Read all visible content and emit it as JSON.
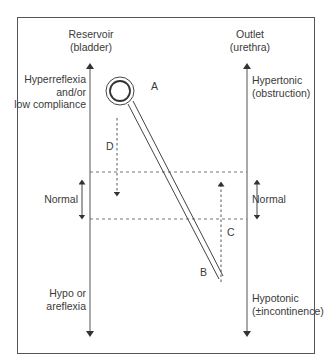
{
  "reservoir": {
    "title_line1": "Reservoir",
    "title_line2": "(bladder)",
    "upper_line1": "Hyperreflexia",
    "upper_line2": "and/or",
    "upper_line3": "low compliance",
    "normal": "Normal",
    "lower_line1": "Hypo or",
    "lower_line2": "areflexia"
  },
  "outlet": {
    "title_line1": "Outlet",
    "title_line2": "(urethra)",
    "upper_line1": "Hypertonic",
    "upper_line2": "(obstruction)",
    "normal": "Normal",
    "lower_line1": "Hypotonic",
    "lower_line2": "(±incontinence)"
  },
  "markers": {
    "a": "A",
    "b": "B",
    "c": "C",
    "d": "D"
  },
  "colors": {
    "line": "#444444",
    "text": "#3a3a3a",
    "background": "#ffffff"
  }
}
